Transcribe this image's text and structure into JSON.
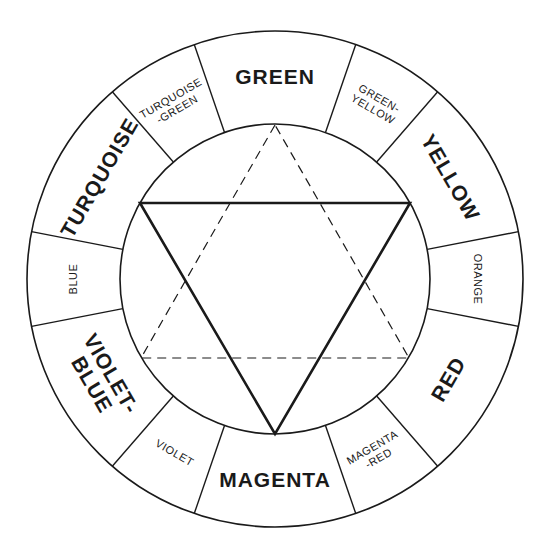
{
  "diagram": {
    "center": [
      275,
      279
    ],
    "outer_radius": 248,
    "inner_radius": 155,
    "segments": [
      {
        "name": "GREEN",
        "lines": [
          "GREEN"
        ],
        "angle": 90,
        "span": 38,
        "type": "primary"
      },
      {
        "name": "TURQUOISE-GREEN",
        "lines": [
          "TURQUOISE",
          "-GREEN"
        ],
        "angle": 120,
        "span": 22,
        "type": "secondary"
      },
      {
        "name": "TURQUOISE",
        "lines": [
          "TURQUOISE"
        ],
        "angle": 150,
        "span": 38,
        "type": "primary"
      },
      {
        "name": "BLUE",
        "lines": [
          "BLUE"
        ],
        "angle": 180,
        "span": 22,
        "type": "secondary"
      },
      {
        "name": "VIOLET-BLUE",
        "lines": [
          "VIOLET-",
          "BLUE"
        ],
        "angle": 210,
        "span": 38,
        "type": "primary"
      },
      {
        "name": "VIOLET",
        "lines": [
          "VIOLET"
        ],
        "angle": 240,
        "span": 22,
        "type": "secondary"
      },
      {
        "name": "MAGENTA",
        "lines": [
          "MAGENTA"
        ],
        "angle": 270,
        "span": 38,
        "type": "primary"
      },
      {
        "name": "MAGENTA-RED",
        "lines": [
          "MAGENTA",
          "-RED"
        ],
        "angle": 300,
        "span": 22,
        "type": "secondary"
      },
      {
        "name": "RED",
        "lines": [
          "RED"
        ],
        "angle": 330,
        "span": 38,
        "type": "primary"
      },
      {
        "name": "ORANGE",
        "lines": [
          "ORANGE"
        ],
        "angle": 0,
        "span": 22,
        "type": "secondary"
      },
      {
        "name": "YELLOW",
        "lines": [
          "YELLOW"
        ],
        "angle": 30,
        "span": 38,
        "type": "primary"
      },
      {
        "name": "GREEN-YELLOW",
        "lines": [
          "GREEN-",
          "YELLOW"
        ],
        "angle": 60,
        "span": 22,
        "type": "secondary"
      }
    ],
    "divider_angles": [
      71,
      109,
      131,
      169,
      191,
      229,
      251,
      289,
      311,
      349,
      11,
      49
    ],
    "solid_triangle": {
      "style": "solid",
      "vertices": [
        [
          140,
          203
        ],
        [
          410,
          203
        ],
        [
          275,
          434
        ]
      ],
      "points_to": [
        "TURQUOISE",
        "YELLOW",
        "MAGENTA"
      ]
    },
    "dashed_triangle": {
      "style": "dashed",
      "vertices": [
        [
          275,
          125
        ],
        [
          141,
          358
        ],
        [
          409,
          358
        ]
      ],
      "points_to": [
        "GREEN",
        "VIOLET-BLUE",
        "RED"
      ]
    },
    "colors": {
      "line": "#1a1a1a",
      "background": "#ffffff"
    }
  }
}
